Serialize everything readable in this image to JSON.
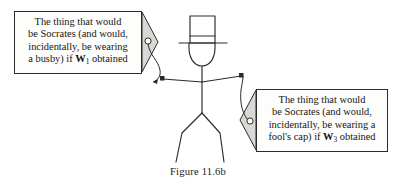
{
  "figure": {
    "caption": "Figure 11.6b",
    "background_color": "#ffffff",
    "ink_color": "#2b2b2b"
  },
  "bubbles": [
    {
      "id": "left",
      "lines": [
        {
          "pre": "The thing that would",
          "var": "",
          "sub": "",
          "post": ""
        },
        {
          "pre": "be Socrates (and would,",
          "var": "",
          "sub": "",
          "post": ""
        },
        {
          "pre": "incidentally, be wearing",
          "var": "",
          "sub": "",
          "post": ""
        },
        {
          "pre": "a busby) if ",
          "var": "W",
          "sub": "1",
          "post": " obtained"
        }
      ],
      "tail_fill": "#d8d8d4"
    },
    {
      "id": "right",
      "lines": [
        {
          "pre": "The thing that would",
          "var": "",
          "sub": "",
          "post": ""
        },
        {
          "pre": "be Socrates (and would,",
          "var": "",
          "sub": "",
          "post": ""
        },
        {
          "pre": "incidentally, be wearing a",
          "var": "",
          "sub": "",
          "post": ""
        },
        {
          "pre": "fool's cap) if ",
          "var": "W",
          "sub": "3",
          "post": " obtained"
        }
      ],
      "tail_fill": "#d8d8d4"
    }
  ],
  "stick_figure": {
    "label": "stick-figure-wearing-top-hat",
    "parts": [
      "top-hat",
      "head",
      "torso",
      "arms",
      "hands",
      "legs"
    ]
  }
}
